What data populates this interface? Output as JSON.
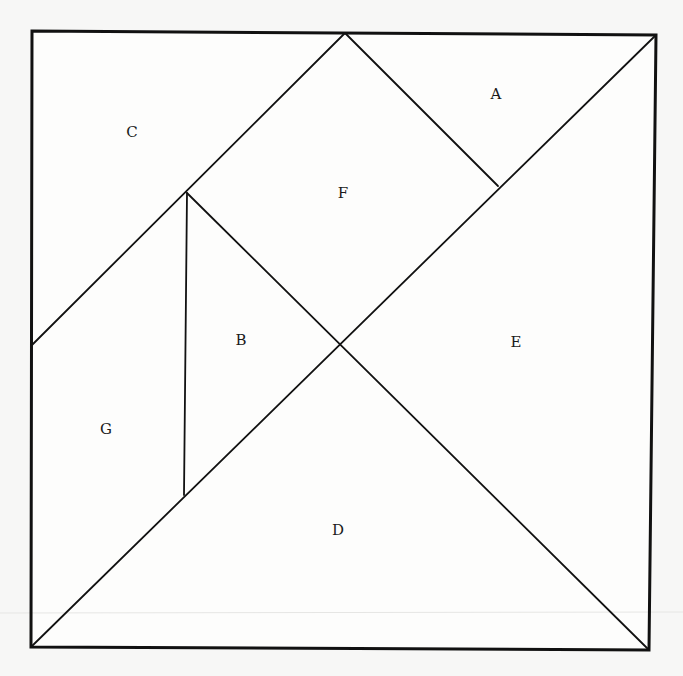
{
  "diagram": {
    "type": "tangram-square-dissection",
    "pieces": [
      {
        "id": "A",
        "label": "A",
        "shape": "triangle"
      },
      {
        "id": "B",
        "label": "B",
        "shape": "triangle"
      },
      {
        "id": "C",
        "label": "C",
        "shape": "triangle"
      },
      {
        "id": "D",
        "label": "D",
        "shape": "triangle"
      },
      {
        "id": "E",
        "label": "E",
        "shape": "triangle"
      },
      {
        "id": "F",
        "label": "F",
        "shape": "rectangle"
      },
      {
        "id": "G",
        "label": "G",
        "shape": "trapezoid"
      }
    ],
    "colors": {
      "line": "#111111",
      "background": "#fdfdfc"
    }
  }
}
